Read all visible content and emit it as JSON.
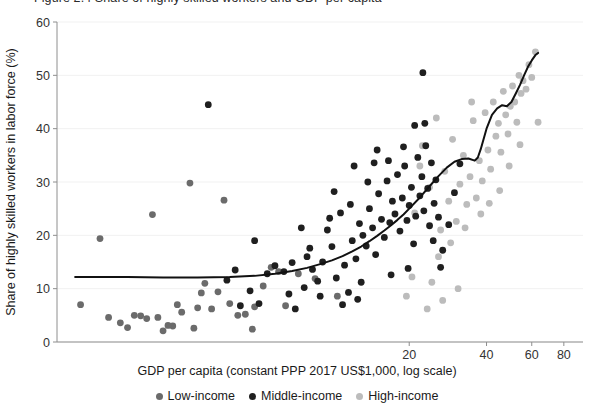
{
  "title": "Figure 2.4  Share of highly skilled workers and GDP per capita",
  "axes": {
    "x_label": "GDP per capita (constant PPP 2017 US$1,000, log scale)",
    "y_label": "Share of highly skilled workers in labor force (%)",
    "x_ticks": [
      "20",
      "40",
      "60",
      "80"
    ],
    "y_ticks": [
      "0",
      "10",
      "20",
      "30",
      "40",
      "50",
      "60"
    ]
  },
  "legend": {
    "items": [
      {
        "label": "Low-income",
        "color": "#6b6b6b"
      },
      {
        "label": "Middle-income",
        "color": "#1f1f1f"
      },
      {
        "label": "High-income",
        "color": "#bcbcbc"
      }
    ]
  },
  "colors": {
    "low_income": "#6b6b6b",
    "middle_income": "#1f1f1f",
    "high_income": "#bcbcbc",
    "trend_line": "#111111",
    "grid": "#f1f1f1",
    "axis": "#8e8e8e"
  },
  "chart_data": {
    "type": "scatter",
    "title": "Figure 2.4  Share of highly skilled workers and GDP per capita",
    "xlabel": "GDP per capita (constant PPP 2017 US$1,000, log scale)",
    "ylabel": "Share of highly skilled workers in labor force (%)",
    "xscale": "log",
    "xlim": [
      0.85,
      95
    ],
    "ylim": [
      0,
      60
    ],
    "xticks": [
      20,
      40,
      60,
      80
    ],
    "yticks": [
      0,
      10,
      20,
      30,
      40,
      50,
      60
    ],
    "grid": "horizontal",
    "legend_position": "below-axis-label",
    "series": [
      {
        "name": "Low-income",
        "color": "#6b6b6b",
        "points": [
          [
            1.05,
            7.0
          ],
          [
            1.25,
            19.4
          ],
          [
            1.35,
            4.6
          ],
          [
            1.5,
            3.6
          ],
          [
            1.7,
            5.0
          ],
          [
            1.9,
            4.4
          ],
          [
            2.0,
            23.9
          ],
          [
            2.1,
            4.6
          ],
          [
            2.2,
            2.1
          ],
          [
            2.4,
            3.0
          ],
          [
            2.5,
            7.0
          ],
          [
            2.6,
            5.6
          ],
          [
            2.8,
            29.8
          ],
          [
            3.0,
            6.4
          ],
          [
            3.2,
            11.0
          ],
          [
            3.4,
            6.2
          ],
          [
            3.6,
            9.4
          ],
          [
            3.8,
            26.6
          ],
          [
            4.0,
            7.2
          ],
          [
            4.3,
            5.0
          ],
          [
            4.6,
            5.2
          ],
          [
            5.0,
            6.6
          ],
          [
            5.4,
            10.5
          ],
          [
            5.8,
            14.0
          ],
          [
            6.2,
            13.2
          ],
          [
            1.6,
            2.7
          ],
          [
            2.3,
            3.1
          ],
          [
            2.9,
            2.6
          ],
          [
            3.1,
            9.2
          ],
          [
            1.8,
            4.9
          ],
          [
            7.4,
            12.8
          ],
          [
            8.6,
            11.9
          ],
          [
            10.5,
            8.6
          ],
          [
            4.9,
            2.4
          ],
          [
            6.6,
            6.8
          ]
        ]
      },
      {
        "name": "Middle-income",
        "color": "#1f1f1f",
        "points": [
          [
            3.3,
            44.5
          ],
          [
            4.4,
            6.8
          ],
          [
            4.8,
            9.6
          ],
          [
            5.2,
            7.2
          ],
          [
            5.6,
            12.8
          ],
          [
            6.0,
            14.3
          ],
          [
            6.5,
            13.2
          ],
          [
            7.0,
            14.9
          ],
          [
            7.2,
            6.2
          ],
          [
            7.8,
            10.2
          ],
          [
            8.0,
            16.0
          ],
          [
            8.4,
            13.6
          ],
          [
            8.8,
            11.4
          ],
          [
            9.2,
            15.0
          ],
          [
            9.6,
            21.0
          ],
          [
            10.0,
            17.9
          ],
          [
            10.4,
            12.0
          ],
          [
            10.8,
            24.2
          ],
          [
            11.2,
            14.4
          ],
          [
            11.6,
            9.3
          ],
          [
            12.0,
            19.0
          ],
          [
            12.4,
            15.6
          ],
          [
            12.8,
            22.2
          ],
          [
            13.2,
            20.0
          ],
          [
            13.6,
            18.0
          ],
          [
            14.0,
            25.0
          ],
          [
            14.4,
            21.4
          ],
          [
            14.8,
            16.4
          ],
          [
            15.2,
            27.8
          ],
          [
            15.6,
            23.0
          ],
          [
            16.0,
            19.6
          ],
          [
            16.4,
            30.2
          ],
          [
            16.8,
            22.4
          ],
          [
            17.2,
            26.4
          ],
          [
            17.6,
            24.0
          ],
          [
            18.0,
            31.4
          ],
          [
            18.4,
            20.8
          ],
          [
            18.8,
            27.0
          ],
          [
            19.2,
            33.0
          ],
          [
            19.6,
            22.8
          ],
          [
            20.0,
            25.6
          ],
          [
            20.4,
            29.0
          ],
          [
            20.8,
            18.4
          ],
          [
            21.2,
            23.6
          ],
          [
            21.6,
            34.6
          ],
          [
            22.0,
            27.4
          ],
          [
            22.4,
            31.0
          ],
          [
            22.8,
            24.6
          ],
          [
            23.2,
            36.8
          ],
          [
            23.6,
            28.8
          ],
          [
            24.0,
            21.8
          ],
          [
            24.4,
            33.6
          ],
          [
            22.6,
            50.5
          ],
          [
            25.0,
            26.0
          ],
          [
            25.4,
            30.4
          ],
          [
            9.0,
            8.6
          ],
          [
            11.0,
            7.0
          ],
          [
            12.6,
            8.0
          ],
          [
            6.8,
            9.0
          ],
          [
            13.0,
            11.2
          ],
          [
            26.0,
            23.4
          ],
          [
            27.0,
            17.2
          ],
          [
            28.5,
            22.0
          ],
          [
            30.0,
            28.0
          ],
          [
            31.5,
            33.4
          ],
          [
            7.6,
            21.4
          ],
          [
            8.2,
            17.6
          ],
          [
            9.8,
            23.2
          ],
          [
            10.2,
            28.2
          ],
          [
            11.8,
            25.8
          ],
          [
            13.8,
            30.0
          ],
          [
            14.6,
            33.6
          ],
          [
            15.0,
            36.0
          ],
          [
            16.6,
            34.0
          ],
          [
            19.0,
            36.6
          ],
          [
            21.0,
            40.6
          ],
          [
            23.0,
            41.0
          ],
          [
            12.2,
            33.0
          ],
          [
            17.0,
            12.6
          ],
          [
            19.8,
            13.8
          ],
          [
            24.8,
            19.0
          ],
          [
            26.5,
            14.0
          ],
          [
            5.0,
            19.0
          ],
          [
            4.2,
            13.5
          ],
          [
            3.9,
            11.6
          ]
        ]
      },
      {
        "name": "High-income",
        "color": "#bcbcbc",
        "points": [
          [
            21.0,
            24.2
          ],
          [
            22.5,
            36.8
          ],
          [
            24.0,
            29.0
          ],
          [
            25.5,
            42.0
          ],
          [
            26.5,
            21.0
          ],
          [
            27.5,
            32.0
          ],
          [
            28.5,
            26.4
          ],
          [
            29.5,
            38.0
          ],
          [
            30.5,
            22.6
          ],
          [
            31.5,
            29.6
          ],
          [
            32.5,
            35.0
          ],
          [
            33.5,
            25.8
          ],
          [
            34.5,
            31.0
          ],
          [
            35.5,
            41.5
          ],
          [
            36.5,
            27.0
          ],
          [
            37.5,
            34.0
          ],
          [
            38.5,
            30.2
          ],
          [
            39.5,
            43.0
          ],
          [
            40.5,
            36.0
          ],
          [
            41.5,
            32.4
          ],
          [
            42.5,
            45.0
          ],
          [
            43.5,
            38.6
          ],
          [
            44.5,
            41.0
          ],
          [
            45.5,
            35.6
          ],
          [
            46.5,
            47.0
          ],
          [
            47.5,
            42.6
          ],
          [
            48.5,
            39.0
          ],
          [
            49.5,
            44.2
          ],
          [
            50.5,
            48.0
          ],
          [
            51.5,
            45.0
          ],
          [
            52.5,
            41.2
          ],
          [
            53.5,
            50.0
          ],
          [
            54.5,
            46.6
          ],
          [
            55.5,
            49.0
          ],
          [
            57.0,
            47.4
          ],
          [
            58.5,
            52.0
          ],
          [
            60.0,
            49.6
          ],
          [
            62.0,
            54.4
          ],
          [
            63.5,
            41.2
          ],
          [
            45.0,
            28.4
          ],
          [
            38.0,
            24.0
          ],
          [
            33.0,
            21.4
          ],
          [
            29.0,
            18.6
          ],
          [
            26.0,
            16.0
          ],
          [
            24.5,
            11.2
          ],
          [
            22.0,
            33.0
          ],
          [
            35.0,
            45.0
          ],
          [
            49.0,
            33.0
          ],
          [
            54.0,
            37.0
          ],
          [
            20.5,
            12.2
          ],
          [
            19.5,
            8.6
          ],
          [
            23.5,
            6.2
          ],
          [
            27.0,
            7.8
          ],
          [
            31.0,
            10.0
          ],
          [
            41.0,
            26.0
          ]
        ]
      }
    ],
    "trend_line": {
      "name": "Smoothed trend (LOESS)",
      "color": "#111111",
      "points": [
        [
          1.0,
          12.2
        ],
        [
          1.6,
          12.2
        ],
        [
          2.2,
          12.1
        ],
        [
          3.0,
          12.1
        ],
        [
          4.0,
          12.2
        ],
        [
          5.0,
          12.4
        ],
        [
          6.0,
          12.8
        ],
        [
          7.0,
          13.3
        ],
        [
          8.0,
          13.9
        ],
        [
          9.0,
          14.6
        ],
        [
          10.0,
          15.3
        ],
        [
          11.0,
          16.1
        ],
        [
          12.0,
          17.0
        ],
        [
          13.0,
          17.9
        ],
        [
          14.0,
          18.9
        ],
        [
          15.0,
          19.9
        ],
        [
          16.0,
          20.9
        ],
        [
          17.0,
          21.9
        ],
        [
          18.0,
          22.9
        ],
        [
          19.0,
          23.9
        ],
        [
          20.0,
          25.0
        ],
        [
          22.0,
          27.1
        ],
        [
          24.0,
          29.2
        ],
        [
          26.0,
          31.1
        ],
        [
          28.0,
          32.7
        ],
        [
          30.0,
          33.8
        ],
        [
          32.0,
          34.3
        ],
        [
          34.0,
          34.4
        ],
        [
          36.0,
          34.0
        ],
        [
          37.0,
          34.6
        ],
        [
          38.0,
          36.2
        ],
        [
          40.0,
          40.0
        ],
        [
          42.0,
          42.6
        ],
        [
          44.0,
          43.8
        ],
        [
          46.0,
          44.4
        ],
        [
          48.0,
          44.2
        ],
        [
          50.0,
          45.0
        ],
        [
          52.0,
          46.6
        ],
        [
          54.0,
          48.2
        ],
        [
          56.0,
          50.0
        ],
        [
          58.0,
          51.6
        ],
        [
          60.0,
          52.8
        ],
        [
          62.0,
          53.8
        ],
        [
          63.5,
          54.2
        ]
      ]
    }
  }
}
